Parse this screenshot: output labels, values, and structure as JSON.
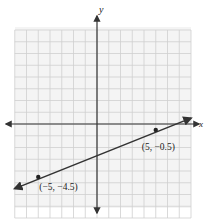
{
  "chart_data": {
    "type": "line",
    "title": "",
    "xlabel": "x",
    "ylabel": "y",
    "xlim": [
      -7,
      8
    ],
    "ylim": [
      -8,
      8
    ],
    "grid": true,
    "series": [
      {
        "name": "line",
        "x": [
          -7,
          8
        ],
        "y": [
          -5.5,
          0.5
        ],
        "equation": "y = 0.4x - 2.5"
      }
    ],
    "points": [
      {
        "x": 5,
        "y": -0.5,
        "label": "(5, −0.5)"
      },
      {
        "x": -5,
        "y": -4.5,
        "label": "(−5, −4.5)"
      }
    ],
    "colors": {
      "grid": "#cfcfcf",
      "axes": "#333333",
      "line": "#333333"
    }
  }
}
